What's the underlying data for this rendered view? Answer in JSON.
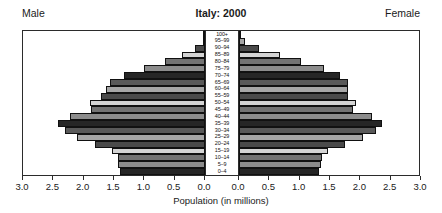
{
  "header": {
    "male_label": "Male",
    "female_label": "Female",
    "title": "Italy: 2000"
  },
  "axis": {
    "title": "Population (in millions)",
    "tick_labels": [
      "3.0",
      "2.5",
      "2.0",
      "1.5",
      "1.0",
      "0.5",
      "0.0",
      "0.0",
      "0.5",
      "1.0",
      "1.5",
      "2.0",
      "2.5",
      "3.0"
    ]
  },
  "chart_data": {
    "type": "bar",
    "subtype": "population-pyramid",
    "title": "Italy: 2000",
    "xlabel": "Population (in millions)",
    "ylabel": "",
    "xlim": [
      0,
      3.0
    ],
    "axis_direction": "mirrored",
    "grid": false,
    "legend": "none",
    "left_series_name": "Male",
    "right_series_name": "Female",
    "categories": [
      "0-4",
      "5-9",
      "10-14",
      "15-19",
      "20-24",
      "25-29",
      "30-34",
      "35-39",
      "40-44",
      "45-49",
      "50-54",
      "55-59",
      "60-64",
      "65-69",
      "70-74",
      "75-79",
      "80-84",
      "85-89",
      "90-94",
      "95-99",
      "100+"
    ],
    "series": [
      {
        "name": "Male",
        "values": [
          1.4,
          1.43,
          1.44,
          1.54,
          1.82,
          2.11,
          2.31,
          2.42,
          2.22,
          1.88,
          1.9,
          1.71,
          1.64,
          1.57,
          1.34,
          1.01,
          0.66,
          0.38,
          0.16,
          0.04,
          0.01
        ]
      },
      {
        "name": "Female",
        "values": [
          1.32,
          1.35,
          1.37,
          1.46,
          1.74,
          2.04,
          2.26,
          2.36,
          2.19,
          1.88,
          1.93,
          1.79,
          1.79,
          1.8,
          1.66,
          1.4,
          1.03,
          0.68,
          0.33,
          0.1,
          0.02
        ]
      }
    ],
    "bar_palette": [
      "#262626",
      "#8c8c8c",
      "#737373",
      "#d4d4d4",
      "#4a4a4a",
      "#a6a6a6",
      "#595959"
    ],
    "age_label_order_top_to_bottom": [
      "100+",
      "95-99",
      "90-94",
      "85-89",
      "80-84",
      "75-79",
      "70-74",
      "65-69",
      "60-64",
      "55-59",
      "50-54",
      "45-49",
      "40-44",
      "35-39",
      "30-34",
      "25-29",
      "20-24",
      "15-19",
      "10-14",
      "5-9",
      "0-4"
    ]
  },
  "colors": {
    "frame": "#2b2b2b",
    "background": "#ffffff",
    "text": "#1a1a1a"
  }
}
